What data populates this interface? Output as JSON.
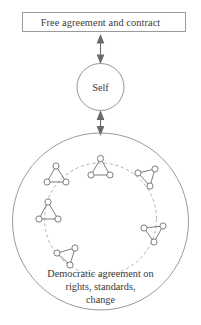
{
  "diagram": {
    "title_box": {
      "label": "Free agreement and contract"
    },
    "center_node": {
      "label": "Self"
    },
    "bottom_caption": {
      "line1": "Democratic agreement on",
      "line2": "rights, standards,",
      "line3": "change"
    },
    "connectors": [
      {
        "name": "self-to-contract",
        "style": "double-headed-arrow"
      },
      {
        "name": "self-to-community",
        "style": "double-headed-arrow"
      }
    ],
    "clusters": [
      {
        "name": "cluster-top",
        "nodes": 3,
        "shape": "triangle"
      },
      {
        "name": "cluster-upper-left",
        "nodes": 3,
        "shape": "triangle"
      },
      {
        "name": "cluster-right",
        "nodes": 3,
        "shape": "triangle"
      },
      {
        "name": "cluster-left",
        "nodes": 3,
        "shape": "triangle"
      },
      {
        "name": "cluster-lower-right",
        "nodes": 3,
        "shape": "triangle"
      },
      {
        "name": "cluster-bottom-left",
        "nodes": 3,
        "shape": "triangle"
      }
    ],
    "colors": {
      "stroke": "#8a8a8a",
      "node_stroke": "#6f6f6f",
      "text": "#3a3a3a",
      "background": "#ffffff"
    }
  }
}
